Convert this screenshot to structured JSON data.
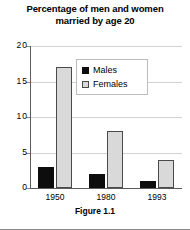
{
  "chart_data": {
    "type": "bar",
    "title": "Percentage of men and women married by age 20",
    "title_line1": "Percentage of men and women",
    "title_line2": "married by age 20",
    "caption": "Figure 1.1",
    "xlabel": "",
    "ylabel": "",
    "categories": [
      "1950",
      "1980",
      "1993"
    ],
    "series": [
      {
        "name": "Males",
        "color": "#0d0d0d",
        "values": [
          3,
          2,
          1
        ]
      },
      {
        "name": "Females",
        "color": "#d9d9d9",
        "values": [
          17,
          8,
          4
        ]
      }
    ],
    "ylim": [
      0,
      20
    ],
    "yticks": [
      "0",
      "5",
      "10",
      "15",
      "20"
    ],
    "ytick_values": [
      0,
      5,
      10,
      15,
      20
    ],
    "grid": true,
    "legend_position": "top-center"
  }
}
